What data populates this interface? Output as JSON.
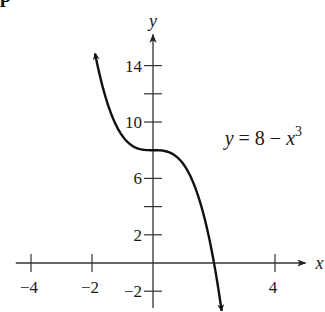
{
  "header": {
    "partial_text": "p"
  },
  "chart_data": {
    "type": "line",
    "title": "",
    "function": "y = 8 - x^3",
    "annotation": {
      "text_main": "y = 8 − x",
      "text_sup": "3",
      "x": 2.35,
      "y": 8.4
    },
    "xlabel": "x",
    "ylabel": "y",
    "xlim": [
      -4.5,
      5
    ],
    "ylim": [
      -3.2,
      16.2
    ],
    "grid": false,
    "legend": null,
    "x_ticks": [
      -4,
      -2,
      4
    ],
    "x_tick_marks": [
      -4,
      -2,
      4
    ],
    "y_ticks": [
      2,
      6,
      10,
      14
    ],
    "y_ticks_negative": [
      -2
    ],
    "y_tick_marks": [
      -2,
      2,
      4,
      6,
      8,
      10,
      12,
      14
    ],
    "x_tick_labels": [
      "-4",
      "-2",
      "4"
    ],
    "y_tick_labels": [
      "14",
      "10",
      "6",
      "2",
      "-2"
    ],
    "series": [
      {
        "name": "y = 8 - x^3",
        "x": [
          -1.9,
          -1.6,
          -1.2,
          -0.8,
          -0.4,
          0,
          0.4,
          0.8,
          1.2,
          1.6,
          2.0,
          2.25
        ],
        "values": [
          14.86,
          12.1,
          9.73,
          8.51,
          8.06,
          8.0,
          7.94,
          7.49,
          6.27,
          3.9,
          0.0,
          -3.39
        ],
        "arrows": "both ends"
      }
    ]
  },
  "layout": {
    "origin_px": [
      153,
      263
    ],
    "px_per_unit_x": 30.5,
    "px_per_unit_y": 14.1,
    "axis_color": "#333333",
    "curve_color": "#111111"
  }
}
